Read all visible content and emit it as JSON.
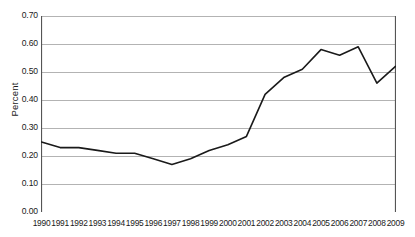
{
  "chart_data": {
    "type": "line",
    "title": "",
    "xlabel": "",
    "ylabel": "Percent",
    "x": [
      1990,
      1991,
      1992,
      1993,
      1994,
      1995,
      1996,
      1997,
      1998,
      1999,
      2000,
      2001,
      2002,
      2003,
      2004,
      2005,
      2006,
      2007,
      2008,
      2009
    ],
    "categories": [
      "1990",
      "1991",
      "1992",
      "1993",
      "1994",
      "1995",
      "1996",
      "1997",
      "1998",
      "1999",
      "2000",
      "2001",
      "2002",
      "2003",
      "2004",
      "2005",
      "2006",
      "2007",
      "2008",
      "2009"
    ],
    "values": [
      0.25,
      0.23,
      0.23,
      0.22,
      0.21,
      0.21,
      0.19,
      0.17,
      0.19,
      0.22,
      0.24,
      0.27,
      0.42,
      0.48,
      0.51,
      0.58,
      0.56,
      0.59,
      0.46,
      0.52
    ],
    "series": [
      {
        "name": "Percent",
        "values": [
          0.25,
          0.23,
          0.23,
          0.22,
          0.21,
          0.21,
          0.19,
          0.17,
          0.19,
          0.22,
          0.24,
          0.27,
          0.42,
          0.48,
          0.51,
          0.58,
          0.56,
          0.59,
          0.46,
          0.52
        ],
        "color": "#1a1a1a"
      }
    ],
    "ylim": [
      0.0,
      0.7
    ],
    "xlim": [
      1990,
      2009
    ],
    "ytick_values": [
      0.0,
      0.1,
      0.2,
      0.3,
      0.4,
      0.5,
      0.6,
      0.7
    ],
    "ytick_labels": [
      "0.00",
      "0.10",
      "0.20",
      "0.30",
      "0.40",
      "0.50",
      "0.60",
      "0.70"
    ],
    "grid": true,
    "grid_color": "#b3b3b3",
    "axis_color": "#555555",
    "legend": false,
    "legend_position": "none",
    "annotations": []
  }
}
